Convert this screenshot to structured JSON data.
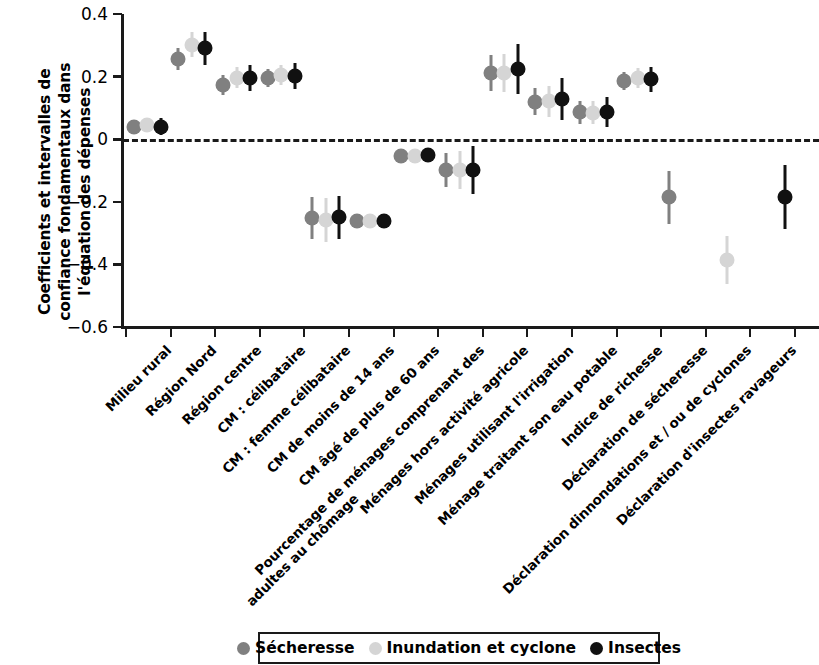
{
  "chart_data": {
    "type": "scatter",
    "title": "",
    "xlabel": "",
    "ylabel": "Coefficients et intervalles de confiance fondamentaux dans l'équation des dépenses",
    "ylim": [
      -0.6,
      0.4
    ],
    "yticks": [
      "0.4",
      "0.2",
      "0",
      "-0.2",
      "-0.4",
      "-0.6"
    ],
    "ytick_values": [
      0.4,
      0.2,
      0,
      -0.2,
      -0.4,
      -0.6
    ],
    "grid": false,
    "zero_reference_line": 0,
    "legend_position": "bottom",
    "series": [
      {
        "name": "Sécheresse",
        "color": "#808080",
        "values": [
          0.04,
          0.255,
          0.172,
          0.196,
          -0.251,
          -0.262,
          -0.055,
          -0.098,
          0.212,
          0.12,
          0.086,
          0.186,
          -0.185,
          null,
          null
        ],
        "ci_low": [
          0.018,
          0.22,
          0.14,
          0.168,
          -0.318,
          -0.272,
          -0.07,
          -0.152,
          0.155,
          0.078,
          0.05,
          0.158,
          -0.272,
          null,
          null
        ],
        "ci_high": [
          0.062,
          0.292,
          0.205,
          0.225,
          -0.185,
          -0.252,
          -0.04,
          -0.045,
          0.268,
          0.162,
          0.122,
          0.214,
          -0.1,
          null,
          null
        ]
      },
      {
        "name": "Inundation et cyclone",
        "color": "#d5d5d5",
        "values": [
          0.045,
          0.302,
          0.196,
          0.205,
          -0.258,
          -0.262,
          -0.055,
          -0.098,
          0.212,
          0.121,
          0.085,
          0.196,
          null,
          -0.385,
          null
        ],
        "ci_low": [
          0.022,
          0.262,
          0.162,
          0.172,
          -0.33,
          -0.274,
          -0.07,
          -0.158,
          0.152,
          0.072,
          0.048,
          0.165,
          null,
          -0.462,
          null
        ],
        "ci_high": [
          0.068,
          0.342,
          0.23,
          0.238,
          -0.188,
          -0.25,
          -0.04,
          -0.038,
          0.272,
          0.17,
          0.122,
          0.228,
          null,
          -0.31,
          null
        ]
      },
      {
        "name": "Insectes",
        "color": "#111111",
        "values": [
          0.04,
          0.29,
          0.196,
          0.202,
          -0.25,
          -0.262,
          -0.052,
          -0.098,
          0.225,
          0.128,
          0.088,
          0.191,
          null,
          null,
          -0.185
        ],
        "ci_low": [
          0.012,
          0.238,
          0.155,
          0.16,
          -0.32,
          -0.272,
          -0.066,
          -0.175,
          0.145,
          0.062,
          0.04,
          0.152,
          null,
          null,
          -0.288
        ],
        "ci_high": [
          0.068,
          0.342,
          0.238,
          0.244,
          -0.18,
          -0.252,
          -0.038,
          -0.022,
          0.305,
          0.194,
          0.136,
          0.23,
          null,
          null,
          -0.082
        ]
      }
    ],
    "categories": [
      {
        "id": "milieu-rural",
        "lines": [
          "Milieu rural"
        ]
      },
      {
        "id": "region-nord",
        "lines": [
          "Région Nord"
        ]
      },
      {
        "id": "region-centre",
        "lines": [
          "Région centre"
        ]
      },
      {
        "id": "cm-celibataire",
        "lines": [
          "CM : célibataire"
        ]
      },
      {
        "id": "cm-femme-celibataire",
        "lines": [
          "CM : femme célibataire"
        ]
      },
      {
        "id": "cm-moins-14-ans",
        "lines": [
          "CM de moins de 14 ans"
        ]
      },
      {
        "id": "cm-plus-60-ans",
        "lines": [
          "CM âgé de plus de 60 ans"
        ]
      },
      {
        "id": "pourcentage-menages-chomage",
        "lines": [
          "Pourcentage de ménages comprenant des",
          "adultes au chômage"
        ]
      },
      {
        "id": "menages-hors-activite-agricole",
        "lines": [
          "Ménages hors activité agricole"
        ]
      },
      {
        "id": "menages-irrigation",
        "lines": [
          "Ménages utilisant l'irrigation"
        ]
      },
      {
        "id": "menage-eau-potable",
        "lines": [
          "Ménage traitant son eau potable"
        ]
      },
      {
        "id": "indice-richesse",
        "lines": [
          "Indice de richesse"
        ]
      },
      {
        "id": "declaration-secheresse",
        "lines": [
          "Déclaration de sécheresse"
        ]
      },
      {
        "id": "declaration-inondations-cyclones",
        "lines": [
          "Déclaration dinnondations et / ou de cyclones"
        ]
      },
      {
        "id": "declaration-insectes",
        "lines": [
          "Déclaration d'insectes ravageurs"
        ]
      }
    ]
  },
  "legend": {
    "items": [
      {
        "label": "Sécheresse",
        "color": "#808080"
      },
      {
        "label": "Inundation et cyclone",
        "color": "#d5d5d5"
      },
      {
        "label": "Insectes",
        "color": "#111111"
      }
    ]
  }
}
